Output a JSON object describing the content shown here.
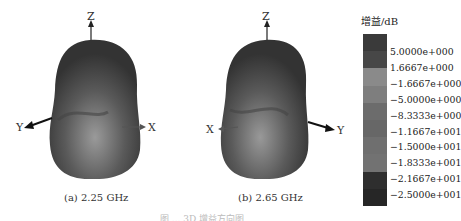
{
  "figures": [
    {
      "id": "a",
      "caption": "(a) 2.25 GHz",
      "axes": {
        "z": "Z",
        "y": "Y",
        "x": "X"
      }
    },
    {
      "id": "b",
      "caption": "(b) 2.65 GHz",
      "axes": {
        "z": "Z",
        "y": "Y",
        "x": "X"
      }
    }
  ],
  "colorbar": {
    "title": "增益/dB",
    "labels": [
      "5.0000e+000",
      "1.6667e+000",
      "−1.6667e+000",
      "−5.0000e+000",
      "−8.3333e+000",
      "−1.1667e+001",
      "−1.5000e+001",
      "−1.8333e+001",
      "−2.1667e+001",
      "−2.5000e+001"
    ],
    "colors": [
      "#3a3a3a",
      "#474747",
      "#8a8a8a",
      "#7e7e7e",
      "#6c6c6c",
      "#676767",
      "#6f6f6f",
      "#727272",
      "#2e2e2e",
      "#262626"
    ]
  },
  "caption": "图 ... 3D 增益方向图"
}
